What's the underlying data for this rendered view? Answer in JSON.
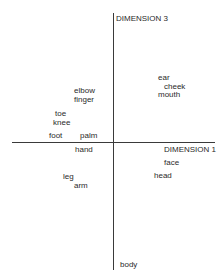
{
  "diagram": {
    "axes": {
      "vertical": {
        "label": "DIMENSION 3"
      },
      "horizontal": {
        "label": "DIMENSION 1"
      }
    },
    "terms": [
      {
        "label": "ear"
      },
      {
        "label": "cheek"
      },
      {
        "label": "mouth"
      },
      {
        "label": "elbow"
      },
      {
        "label": "finger"
      },
      {
        "label": "toe"
      },
      {
        "label": "knee"
      },
      {
        "label": "foot"
      },
      {
        "label": "palm"
      },
      {
        "label": "hand"
      },
      {
        "label": "face"
      },
      {
        "label": "head"
      },
      {
        "label": "leg"
      },
      {
        "label": "arm"
      },
      {
        "label": "body"
      }
    ]
  }
}
